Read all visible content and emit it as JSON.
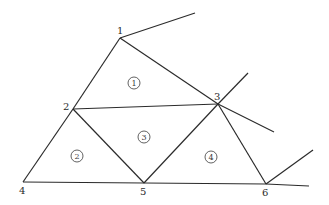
{
  "diagram": {
    "type": "finite-element-mesh",
    "nodes": [
      {
        "id": "1",
        "label": "1",
        "x": 120,
        "y": 38,
        "label_dx": -3,
        "label_dy": -4
      },
      {
        "id": "2",
        "label": "2",
        "x": 73,
        "y": 109,
        "label_dx": -10,
        "label_dy": 1
      },
      {
        "id": "3",
        "label": "3",
        "x": 218,
        "y": 104,
        "label_dx": -4,
        "label_dy": -4
      },
      {
        "id": "4",
        "label": "4",
        "x": 23,
        "y": 182,
        "label_dx": -4,
        "label_dy": 12
      },
      {
        "id": "5",
        "label": "5",
        "x": 144,
        "y": 183,
        "label_dx": -4,
        "label_dy": 12
      },
      {
        "id": "6",
        "label": "6",
        "x": 266,
        "y": 184,
        "label_dx": -4,
        "label_dy": 12
      }
    ],
    "edges": [
      {
        "from": "1",
        "to": "2"
      },
      {
        "from": "1",
        "to": "3"
      },
      {
        "from": "2",
        "to": "3"
      },
      {
        "from": "2",
        "to": "4"
      },
      {
        "from": "2",
        "to": "5"
      },
      {
        "from": "3",
        "to": "5"
      },
      {
        "from": "3",
        "to": "6"
      },
      {
        "from": "4",
        "to": "5"
      },
      {
        "from": "5",
        "to": "6"
      }
    ],
    "open_edges": [
      {
        "from": "1",
        "x2": 195,
        "y2": 13
      },
      {
        "from": "3",
        "x2": 248,
        "y2": 73
      },
      {
        "from": "3",
        "x2": 274,
        "y2": 132
      },
      {
        "from": "6",
        "x2": 313,
        "y2": 150
      },
      {
        "from": "6",
        "x2": 309,
        "y2": 186
      }
    ],
    "elements": [
      {
        "id": "1",
        "label": "1",
        "nodes": [
          "1",
          "2",
          "3"
        ],
        "x": 134,
        "y": 83
      },
      {
        "id": "2",
        "label": "2",
        "nodes": [
          "2",
          "4",
          "5"
        ],
        "x": 77,
        "y": 156
      },
      {
        "id": "3",
        "label": "3",
        "nodes": [
          "2",
          "3",
          "5"
        ],
        "x": 144,
        "y": 137
      },
      {
        "id": "4",
        "label": "4",
        "nodes": [
          "3",
          "5",
          "6"
        ],
        "x": 211,
        "y": 157
      }
    ],
    "colors": {
      "line": "#2b2b2b",
      "background": "#ffffff"
    }
  }
}
